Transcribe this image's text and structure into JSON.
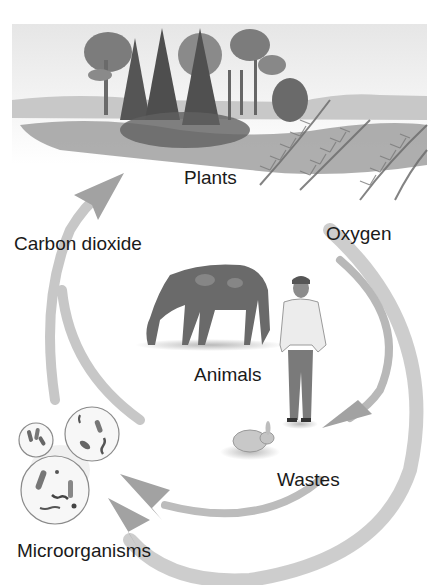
{
  "diagram": {
    "type": "cycle",
    "nodes": [
      {
        "id": "plants",
        "label": "Plants"
      },
      {
        "id": "animals",
        "label": "Animals"
      },
      {
        "id": "wastes",
        "label": "Wastes"
      },
      {
        "id": "microorganisms",
        "label": "Microorganisms"
      }
    ],
    "edges": [
      {
        "from": "plants",
        "to": "wastes",
        "label": "Oxygen"
      },
      {
        "from": "microorganisms",
        "to": "plants",
        "label": "Carbon dioxide"
      },
      {
        "from": "wastes",
        "to": "microorganisms",
        "label": ""
      },
      {
        "from": "plants",
        "to": "microorganisms",
        "label": ""
      }
    ]
  },
  "labels": {
    "plants": "Plants",
    "carbon_dioxide": "Carbon dioxide",
    "oxygen": "Oxygen",
    "animals": "Animals",
    "wastes": "Wastes",
    "microorganisms": "Microorganisms"
  },
  "colors": {
    "arrow": "#a8a8a8",
    "text": "#1a1a1a",
    "scene": "#7a7a7a"
  }
}
